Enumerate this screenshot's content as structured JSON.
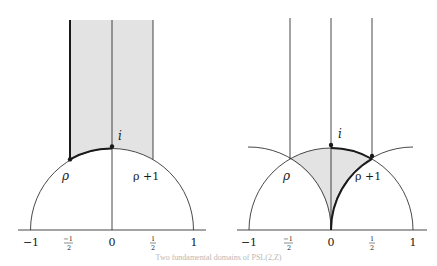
{
  "figures": [
    {
      "id": "left",
      "description": "Standard fundamental domain of the modular group",
      "labels": {
        "top_point": "i",
        "left_corner": "ρ",
        "right_label": "ρ +1"
      },
      "ticks": [
        "−1",
        "−½",
        "0",
        "½",
        "1"
      ],
      "tick_fractions": {
        "neg_half_num": "−1",
        "neg_half_den": "2",
        "half_num": "1",
        "half_den": "2"
      }
    },
    {
      "id": "right",
      "description": "Alternative fundamental domain bounded by unit circles",
      "labels": {
        "top_point": "i",
        "left_corner": "ρ",
        "right_label": "ρ +1"
      },
      "ticks": [
        "−1",
        "−½",
        "0",
        "½",
        "1"
      ],
      "tick_fractions": {
        "neg_half_num": "−1",
        "neg_half_den": "2",
        "half_num": "1",
        "half_den": "2"
      }
    }
  ],
  "colors": {
    "shade": "#e3e3e3",
    "line": "#1a1a1a"
  },
  "caption": "Two fundamental domains of PSL(2,Z)"
}
